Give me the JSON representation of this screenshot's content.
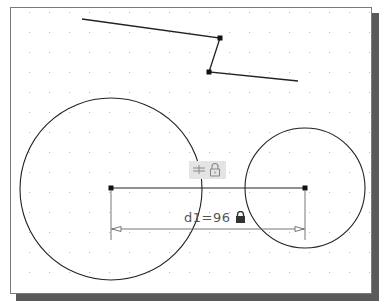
{
  "canvas": {
    "background": "#ffffff",
    "border_color": "#7a7a7a",
    "shadow_color": "#5a5a5a",
    "grid": {
      "spacing": 20,
      "origin_x": 29,
      "origin_y": 12,
      "dot_color": "#b8b8b8"
    }
  },
  "geometry": {
    "polyline": [
      [
        82,
        19
      ],
      [
        220,
        38
      ],
      [
        209,
        72
      ],
      [
        298,
        81
      ]
    ],
    "polyline_grips": [
      [
        220,
        38
      ],
      [
        209,
        72
      ]
    ],
    "circles": [
      {
        "name": "large-circle",
        "cx": 111,
        "cy": 189,
        "r": 91
      },
      {
        "name": "small-circle",
        "cx": 305,
        "cy": 188,
        "r": 60
      }
    ],
    "center_line": {
      "x1": 111,
      "y1": 188,
      "x2": 305,
      "y2": 188
    },
    "stroke_color": "#222222"
  },
  "constraint_badge": {
    "icons": [
      "horizontal-constraint-icon",
      "lock-icon"
    ],
    "background": "#e4e4e4"
  },
  "dimension": {
    "label": "d1=96",
    "name": "d1",
    "value": 96,
    "locked": true,
    "line_y": 229,
    "x1": 111,
    "x2": 305,
    "extension_bottom": 240,
    "color": "#666666"
  }
}
